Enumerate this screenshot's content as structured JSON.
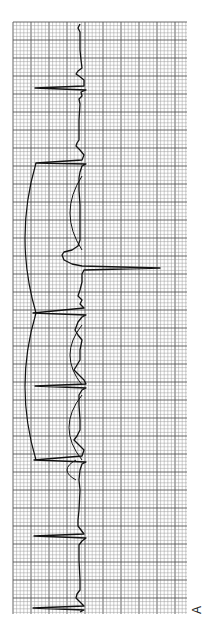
{
  "figure": {
    "panel_label": "A",
    "orientation": "rotated-90-ccw",
    "colors": {
      "paper": "#ffffff",
      "grid_minor": "#9a9a9a",
      "grid_major": "#555555",
      "trace": "#111111"
    },
    "grid": {
      "x0": 13,
      "y0": 22,
      "x1": 187,
      "y1": 614,
      "minor": 3.6,
      "major": 18
    }
  },
  "trace": {
    "baseline_x": 80,
    "points": [
      [
        80,
        24
      ],
      [
        78,
        28
      ],
      [
        80,
        32
      ],
      [
        80,
        50
      ],
      [
        81,
        60
      ],
      [
        82,
        68
      ],
      [
        78,
        71
      ],
      [
        76,
        74
      ],
      [
        79,
        76
      ],
      [
        84,
        80
      ],
      [
        84,
        86
      ],
      [
        35,
        88
      ],
      [
        86,
        90
      ],
      [
        81,
        92
      ],
      [
        82,
        96
      ],
      [
        79,
        99
      ],
      [
        80,
        104
      ],
      [
        79,
        120
      ],
      [
        79,
        140
      ],
      [
        77,
        143
      ],
      [
        76,
        146
      ],
      [
        80,
        150
      ],
      [
        84,
        155
      ],
      [
        82,
        160
      ],
      [
        36,
        163
      ],
      [
        86,
        164
      ],
      [
        82,
        166
      ],
      [
        80,
        172
      ],
      [
        79,
        178
      ],
      [
        79,
        190
      ],
      [
        80,
        205
      ],
      [
        80,
        225
      ],
      [
        80,
        240
      ],
      [
        78,
        246
      ],
      [
        72,
        250
      ],
      [
        64,
        252
      ],
      [
        62,
        255
      ],
      [
        64,
        260
      ],
      [
        72,
        264
      ],
      [
        82,
        266
      ],
      [
        160,
        268
      ],
      [
        84,
        270
      ],
      [
        82,
        274
      ],
      [
        82,
        282
      ],
      [
        80,
        290
      ],
      [
        78,
        296
      ],
      [
        82,
        300
      ],
      [
        80,
        304
      ],
      [
        84,
        308
      ],
      [
        33,
        313
      ],
      [
        86,
        315
      ],
      [
        82,
        317
      ],
      [
        78,
        322
      ],
      [
        75,
        330
      ],
      [
        78,
        335
      ],
      [
        82,
        340
      ],
      [
        80,
        350
      ],
      [
        80,
        360
      ],
      [
        77,
        365
      ],
      [
        74,
        370
      ],
      [
        78,
        374
      ],
      [
        84,
        380
      ],
      [
        86,
        384
      ],
      [
        35,
        386
      ],
      [
        86,
        388
      ],
      [
        82,
        390
      ],
      [
        79,
        395
      ],
      [
        79,
        405
      ],
      [
        80,
        420
      ],
      [
        80,
        430
      ],
      [
        77,
        436
      ],
      [
        74,
        440
      ],
      [
        78,
        444
      ],
      [
        84,
        450
      ],
      [
        82,
        456
      ],
      [
        34,
        460
      ],
      [
        86,
        462
      ],
      [
        82,
        464
      ],
      [
        80,
        470
      ],
      [
        79,
        480
      ],
      [
        80,
        490
      ],
      [
        79,
        510
      ],
      [
        78,
        520
      ],
      [
        78,
        526
      ],
      [
        81,
        530
      ],
      [
        84,
        534
      ],
      [
        34,
        536
      ],
      [
        86,
        538
      ],
      [
        82,
        541
      ],
      [
        79,
        545
      ],
      [
        79,
        560
      ],
      [
        80,
        580
      ],
      [
        80,
        590
      ],
      [
        77,
        594
      ],
      [
        76,
        598
      ],
      [
        80,
        602
      ],
      [
        84,
        606
      ],
      [
        33,
        608
      ],
      [
        84,
        610
      ],
      [
        80,
        612
      ]
    ]
  },
  "brackets": [
    {
      "name": "bracket-upper",
      "top_y": 163,
      "bottom_y": 313,
      "outer_x": 18,
      "inner_x": 36
    },
    {
      "name": "bracket-lower",
      "top_y": 313,
      "bottom_y": 460,
      "outer_x": 18,
      "inner_x": 36
    }
  ],
  "ladder_loops": [
    {
      "name": "loop-1",
      "top_y": 176,
      "bottom_y": 250,
      "left_x": 64,
      "right_x": 82
    },
    {
      "name": "loop-2",
      "top_y": 325,
      "bottom_y": 385,
      "left_x": 64,
      "right_x": 82
    },
    {
      "name": "loop-3",
      "top_y": 395,
      "bottom_y": 460,
      "left_x": 62,
      "right_x": 82
    },
    {
      "name": "loop-4",
      "top_y": 460,
      "bottom_y": 480,
      "left_x": 64,
      "right_x": 76
    }
  ],
  "annotations": {
    "normal_qrs_y": [
      88,
      163,
      236,
      313,
      386,
      460,
      536,
      608
    ],
    "ectopic_qrs_y": 268
  }
}
